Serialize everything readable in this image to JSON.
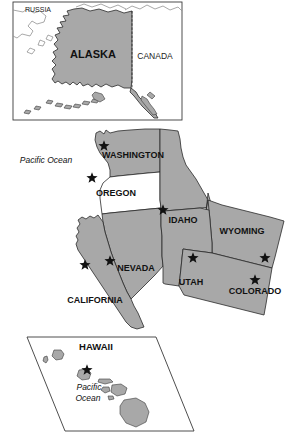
{
  "figure": {
    "kind": "reference-map",
    "background_color": "#ffffff",
    "shaded_fill": "#a8a8a8",
    "unshaded_fill": "#ffffff",
    "outline_color": "#2a2a2a",
    "marker_glyph": "star"
  },
  "insets": {
    "alaska": {
      "name": "alaska-inset",
      "frame": {
        "x": 13,
        "y": 2,
        "width": 169,
        "height": 118
      },
      "labels": {
        "russia": "RUSSIA",
        "alaska": "ALASKA",
        "canada": "CANADA"
      },
      "shaded": [
        "ALASKA"
      ],
      "markers": 0
    },
    "hawaii": {
      "name": "hawaii-inset",
      "shape": "parallelogram",
      "labels": {
        "hawaii": "HAWAII",
        "ocean_line1": "Pacific",
        "ocean_line2": "Ocean"
      },
      "shaded": [
        "HAWAII"
      ],
      "markers": 1
    }
  },
  "main_map": {
    "name": "western-states-map",
    "ocean_label": "Pacific Ocean",
    "states": [
      {
        "label": "WASHINGTON",
        "shaded": true,
        "stars": 1,
        "label_x": 133,
        "label_y": 156
      },
      {
        "label": "OREGON",
        "shaded": false,
        "stars": 1,
        "label_x": 116,
        "label_y": 194
      },
      {
        "label": "IDAHO",
        "shaded": true,
        "stars": 1,
        "label_x": 183,
        "label_y": 221
      },
      {
        "label": "WYOMING",
        "shaded": true,
        "stars": 1,
        "label_x": 242,
        "label_y": 232
      },
      {
        "label": "NEVADA",
        "shaded": true,
        "stars": 1,
        "label_x": 136,
        "label_y": 269
      },
      {
        "label": "UTAH",
        "shaded": true,
        "stars": 1,
        "label_x": 191,
        "label_y": 283
      },
      {
        "label": "COLORADO",
        "shaded": true,
        "stars": 1,
        "label_x": 255,
        "label_y": 292
      },
      {
        "label": "CALIFORNIA",
        "shaded": true,
        "stars": 1,
        "label_x": 95,
        "label_y": 301
      }
    ],
    "stars": [
      {
        "for": "WASHINGTON",
        "x": 104,
        "y": 145
      },
      {
        "for": "OREGON",
        "x": 92,
        "y": 177
      },
      {
        "for": "IDAHO",
        "x": 163,
        "y": 209
      },
      {
        "for": "NEVADA",
        "x": 110,
        "y": 260
      },
      {
        "for": "CALIFORNIA",
        "x": 85,
        "y": 264
      },
      {
        "for": "UTAH",
        "x": 193,
        "y": 257
      },
      {
        "for": "WYOMING",
        "x": 265,
        "y": 257
      },
      {
        "for": "COLORADO",
        "x": 255,
        "y": 279
      }
    ]
  }
}
